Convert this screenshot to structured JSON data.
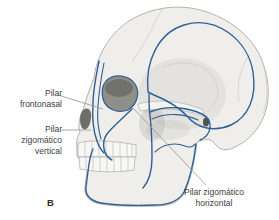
{
  "figure": {
    "letter": "B",
    "labels": {
      "frontonasal": "Pilar\nfrontonasal",
      "zygomatic_vertical": "Pilar\nzigomático\nvertical",
      "zygomatic_horizontal": "Pilar zigomático\nhorizontal"
    },
    "colors": {
      "buttress_line": "#2e5f96",
      "leader_line": "#a0a09a",
      "label_text": "#3d3d3d",
      "bone_fill": "#efeeeb",
      "bone_outline": "#b3b3ad",
      "background": "#ffffff"
    }
  }
}
